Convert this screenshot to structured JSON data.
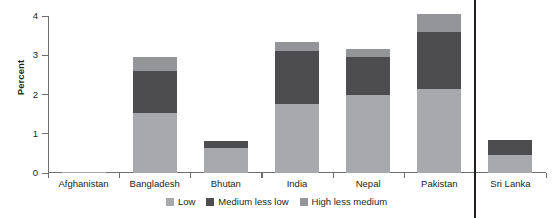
{
  "chart_data": {
    "type": "bar",
    "subtype": "stacked",
    "title": "",
    "xlabel": "",
    "ylabel": "Percent",
    "ylim": [
      0,
      4
    ],
    "yticks": [
      0,
      1,
      2,
      3,
      4
    ],
    "ytick_labels": [
      "0",
      "1",
      "2",
      "3",
      "4"
    ],
    "grid": false,
    "legend_position": "bottom-center",
    "categories": [
      "Afghanistan",
      "Bangladesh",
      "Bhutan",
      "India",
      "Nepal",
      "Pakistan",
      "Sri Lanka"
    ],
    "series": [
      {
        "name": "Low",
        "color": "#a7a9ac",
        "values": [
          0.02,
          1.52,
          0.65,
          1.75,
          2.0,
          2.15,
          0.45
        ]
      },
      {
        "name": "Medium less low",
        "color": "#4d4d4f",
        "values": [
          0.0,
          1.09,
          0.17,
          1.35,
          0.95,
          1.45,
          0.4
        ]
      },
      {
        "name": "High less medium",
        "color": "#939598",
        "values": [
          0.0,
          0.34,
          0.0,
          0.25,
          0.2,
          0.45,
          0.0
        ]
      }
    ],
    "totals": [
      0.02,
      2.95,
      0.82,
      3.35,
      3.15,
      4.05,
      0.85
    ],
    "annotations": {
      "separator_after_category": "Pakistan"
    }
  },
  "legend": {
    "items": [
      {
        "label": "Low",
        "color": "#a7a9ac"
      },
      {
        "label": "Medium less low",
        "color": "#4d4d4f"
      },
      {
        "label": "High less medium",
        "color": "#939598"
      }
    ]
  }
}
